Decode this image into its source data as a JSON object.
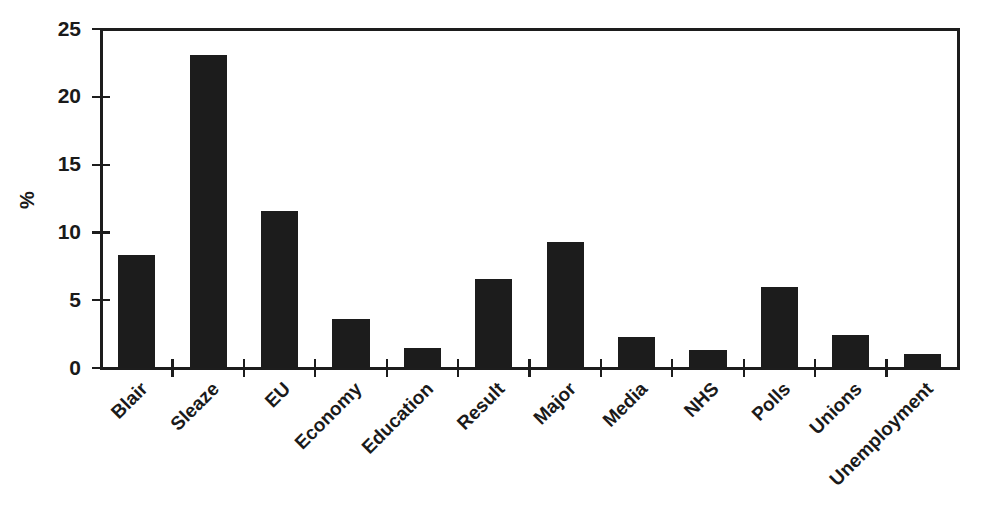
{
  "chart_data": {
    "type": "bar",
    "title": "",
    "subtitle": "",
    "xlabel": "",
    "ylabel": "%",
    "ylim": [
      0,
      25
    ],
    "ytick_labels": [
      "0",
      "5",
      "10",
      "15",
      "20",
      "25"
    ],
    "ytick_values": [
      0,
      5,
      10,
      15,
      20,
      25
    ],
    "grid": false,
    "legend": null,
    "bar_color": "#1c1c1c",
    "axis_color": "#1d1d1d",
    "background_color": "#ffffff",
    "xtick_label_rotation": 45,
    "categories": [
      "Blair",
      "Sleaze",
      "EU",
      "Economy",
      "Education",
      "Result",
      "Major",
      "Media",
      "NHS",
      "Polls",
      "Unions",
      "Unemployment"
    ],
    "values": [
      8.3,
      23.1,
      11.6,
      3.6,
      1.5,
      6.6,
      9.3,
      2.3,
      1.3,
      6.0,
      2.4,
      1.0
    ],
    "series": [
      {
        "name": "Percentage",
        "values": [
          8.3,
          23.1,
          11.6,
          3.6,
          1.5,
          6.6,
          9.3,
          2.3,
          1.3,
          6.0,
          2.4,
          1.0
        ]
      }
    ]
  }
}
